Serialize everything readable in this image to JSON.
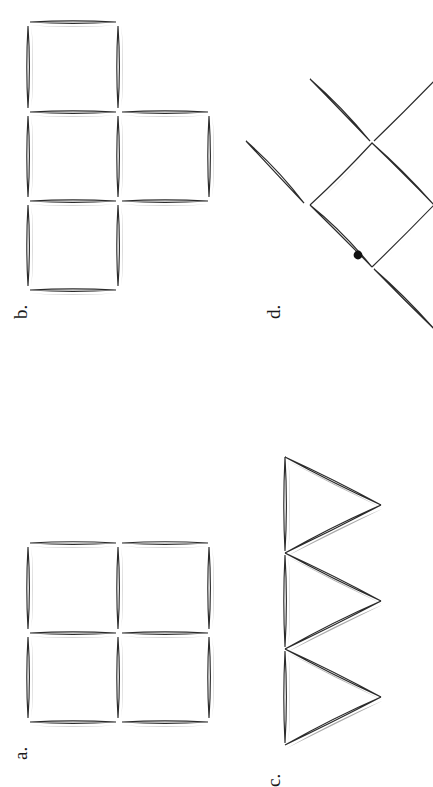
{
  "page": {
    "background_color": "#ffffff",
    "width": 433,
    "height": 781,
    "orientation_note": "figures and labels rotated 90 degrees counter-clockwise",
    "ink_color": "#2b2b2b",
    "shadow_color": "#9a9a9a",
    "dot_color": "#111111"
  },
  "panels": [
    {
      "id": "a",
      "label": "a.",
      "figure": "two-by-two grid of four squares",
      "stick_count": 12,
      "label_x": 30,
      "label_y": 760
    },
    {
      "id": "b",
      "label": "b.",
      "figure": "four squares in a T arrangement: three stacked vertically plus one to the right of the middle",
      "stick_count": 13,
      "label_x": 30,
      "label_y": 332
    },
    {
      "id": "c",
      "label": "c.",
      "figure": "three triangles chained in a vertical row pointing right",
      "stick_count": 9,
      "label_x": 283,
      "label_y": 768
    },
    {
      "id": "d",
      "label": "d.",
      "figure": "diamond of four diagonal sticks with four diagonal sticks radiating outward and a dot marker inside",
      "stick_count": 8,
      "dot_marker": true,
      "label_x": 283,
      "label_y": 330
    }
  ],
  "figure_a": {
    "type": "square-grid",
    "columns": 2,
    "rows": 2,
    "origin_x": 30,
    "origin_y": 543,
    "cell": 90
  },
  "figure_b": {
    "type": "square-grid-irregular",
    "origin_x": 28,
    "origin_y": 22,
    "cell": 90,
    "cells": [
      [
        0,
        0
      ],
      [
        0,
        1
      ],
      [
        0,
        2
      ],
      [
        1,
        1
      ]
    ]
  },
  "figure_c": {
    "type": "triangle-chain",
    "triangles": 3,
    "base_x": 285,
    "apex_x": 381,
    "origin_y": 457,
    "side": 96
  },
  "figure_d": {
    "type": "diamond-with-rays",
    "center_x": 372,
    "center_y": 205,
    "half": 62,
    "dot_x": 358,
    "dot_y": 255
  }
}
